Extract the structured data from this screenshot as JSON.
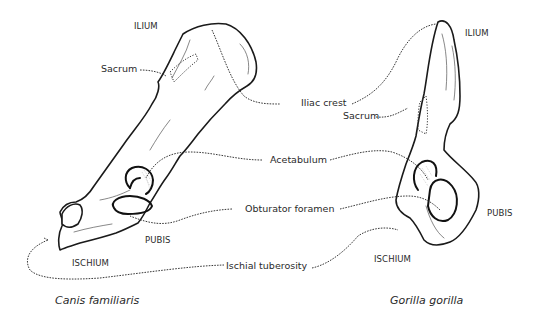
{
  "figure": {
    "left_specimen": {
      "species": "Canis familiaris",
      "labels": {
        "ilium": "ILIUM",
        "sacrum": "Sacrum",
        "pubis": "PUBIS",
        "ischium": "ISCHIUM"
      }
    },
    "right_specimen": {
      "species": "Gorilla gorilla",
      "labels": {
        "ilium": "ILIUM",
        "sacrum": "Sacrum",
        "pubis": "PUBIS",
        "ischium": "ISCHIUM"
      }
    },
    "shared_labels": {
      "iliac_crest": "Iliac crest",
      "acetabulum": "Acetabulum",
      "obturator_foramen": "Obturator foramen",
      "ischial_tuberosity": "Ischial tuberosity"
    }
  }
}
